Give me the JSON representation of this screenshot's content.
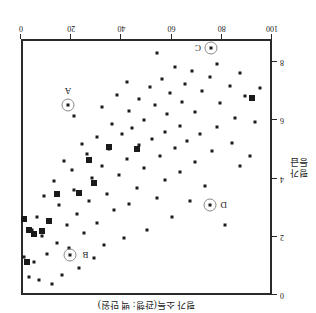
{
  "chart_data": {
    "type": "scatter",
    "title": "",
    "xlabel": "평가 소득(관행: 백 만원)",
    "ylabel_lines": [
      "평가",
      "등급"
    ],
    "xlim": [
      100,
      0
    ],
    "ylim": [
      0,
      8.8
    ],
    "x_axis_reversed": true,
    "y_axis_reversed": true,
    "x_axis_position": "top",
    "y_axis_position": "right",
    "grid": false,
    "legend": "none",
    "xticks": [
      100,
      80,
      60,
      40,
      20,
      0
    ],
    "yticks": [
      0,
      2,
      4,
      6,
      8
    ],
    "series": [
      {
        "name": "dot",
        "marker": "small-dot",
        "points": [
          [
            8,
            0.45
          ],
          [
            13,
            0.32
          ],
          [
            4,
            0.55
          ],
          [
            17,
            0.62
          ],
          [
            6,
            1.05
          ],
          [
            24,
            0.85
          ],
          [
            11,
            1.35
          ],
          [
            2,
            1.25
          ],
          [
            20,
            1.55
          ],
          [
            30,
            1.22
          ],
          [
            15,
            1.72
          ],
          [
            9,
            1.95
          ],
          [
            34,
            1.65
          ],
          [
            26,
            2.05
          ],
          [
            5,
            2.15
          ],
          [
            19,
            2.35
          ],
          [
            42,
            1.88
          ],
          [
            12,
            2.52
          ],
          [
            31,
            2.42
          ],
          [
            23,
            2.72
          ],
          [
            7,
            2.62
          ],
          [
            51,
            2.18
          ],
          [
            38,
            2.85
          ],
          [
            16,
            3.02
          ],
          [
            28,
            3.15
          ],
          [
            44,
            3.05
          ],
          [
            61,
            2.62
          ],
          [
            10,
            3.32
          ],
          [
            35,
            3.42
          ],
          [
            22,
            3.55
          ],
          [
            55,
            3.28
          ],
          [
            47,
            3.62
          ],
          [
            68,
            3.15
          ],
          [
            14,
            3.85
          ],
          [
            29,
            3.95
          ],
          [
            40,
            4.05
          ],
          [
            58,
            3.88
          ],
          [
            74,
            3.68
          ],
          [
            21,
            4.22
          ],
          [
            33,
            4.35
          ],
          [
            50,
            4.28
          ],
          [
            64,
            4.15
          ],
          [
            82,
            2.35
          ],
          [
            18,
            4.55
          ],
          [
            43,
            4.62
          ],
          [
            27,
            4.78
          ],
          [
            70,
            4.52
          ],
          [
            56,
            4.72
          ],
          [
            88,
            4.38
          ],
          [
            36,
            4.95
          ],
          [
            25,
            5.12
          ],
          [
            62,
            4.98
          ],
          [
            48,
            5.08
          ],
          [
            77,
            4.88
          ],
          [
            31,
            5.35
          ],
          [
            53,
            5.28
          ],
          [
            41,
            5.45
          ],
          [
            67,
            5.22
          ],
          [
            85,
            5.15
          ],
          [
            58,
            5.55
          ],
          [
            45,
            5.68
          ],
          [
            72,
            5.48
          ],
          [
            92,
            4.72
          ],
          [
            37,
            5.82
          ],
          [
            64,
            5.75
          ],
          [
            50,
            5.95
          ],
          [
            79,
            5.72
          ],
          [
            22,
            6.08
          ],
          [
            59,
            6.15
          ],
          [
            44,
            6.25
          ],
          [
            86,
            6.02
          ],
          [
            70,
            6.22
          ],
          [
            33,
            6.38
          ],
          [
            54,
            6.45
          ],
          [
            94,
            5.88
          ],
          [
            65,
            6.55
          ],
          [
            48,
            6.68
          ],
          [
            80,
            6.52
          ],
          [
            39,
            6.82
          ],
          [
            60,
            6.88
          ],
          [
            73,
            6.95
          ],
          [
            90,
            6.78
          ],
          [
            52,
            7.08
          ],
          [
            66,
            7.18
          ],
          [
            43,
            7.25
          ],
          [
            84,
            7.12
          ],
          [
            57,
            7.35
          ],
          [
            76,
            7.42
          ],
          [
            96,
            7.05
          ],
          [
            69,
            7.62
          ],
          [
            88,
            7.55
          ],
          [
            62,
            7.78
          ],
          [
            79,
            7.88
          ],
          [
            55,
            8.25
          ]
        ]
      },
      {
        "name": "square",
        "marker": "large-square",
        "points": [
          [
            3,
            1.08
          ],
          [
            6,
            2.02
          ],
          [
            9,
            2.12
          ],
          [
            4,
            2.18
          ],
          [
            12,
            2.48
          ],
          [
            2,
            2.55
          ],
          [
            15,
            3.42
          ],
          [
            24,
            3.45
          ],
          [
            30,
            3.78
          ],
          [
            28,
            4.58
          ],
          [
            47,
            4.95
          ],
          [
            36,
            5.02
          ],
          [
            93,
            6.72
          ]
        ]
      }
    ],
    "annotations": [
      {
        "label": "A",
        "x": 19.5,
        "y": 6.45,
        "label_dx": 0,
        "label_dy": 14
      },
      {
        "label": "B",
        "x": 20.5,
        "y": 1.32,
        "label_dx": -15,
        "label_dy": 0
      },
      {
        "label": "C",
        "x": 76.5,
        "y": 8.42,
        "label_dx": 13,
        "label_dy": 0
      },
      {
        "label": "D",
        "x": 76.0,
        "y": 3.02,
        "label_dx": -14,
        "label_dy": 0
      }
    ]
  },
  "axes": {
    "x_title": "평가 소득(관행: 백 만원)",
    "y_title_line1": "평가",
    "y_title_line2": "등급",
    "x_tick_labels": [
      "100",
      "80",
      "60",
      "40",
      "20",
      "0"
    ],
    "y_tick_labels": [
      "0",
      "2",
      "4",
      "6",
      "8"
    ]
  },
  "colors": {
    "frame": "#2a2a2a",
    "marker": "#1a1a1a",
    "annotation_ring": "#8a8a8a",
    "background": "#ffffff"
  }
}
